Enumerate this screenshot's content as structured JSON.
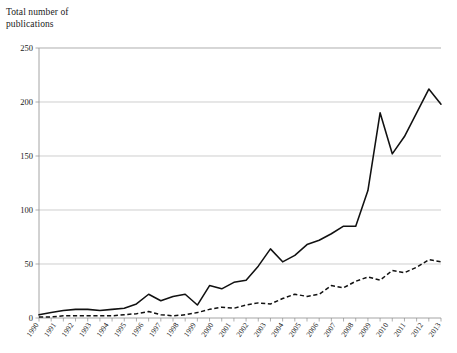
{
  "chart_data": {
    "type": "line",
    "title": "Total number of\npublications",
    "xlabel": "",
    "ylabel": "Total number of publications",
    "ylim": [
      0,
      250
    ],
    "yticks": [
      0,
      50,
      100,
      150,
      200,
      250
    ],
    "grid": true,
    "legend": "none",
    "categories": [
      "1990",
      "1991",
      "1992",
      "1993",
      "1994",
      "1995",
      "1996",
      "1997",
      "1998",
      "1999",
      "2000",
      "2001",
      "2002",
      "2003",
      "2004",
      "2005",
      "2006",
      "2007",
      "2008",
      "2009",
      "2010",
      "2011",
      "2012",
      "2013"
    ],
    "series": [
      {
        "name": "solid-line",
        "style": "solid",
        "color": "#111111",
        "values": [
          3,
          5,
          8,
          9,
          9,
          8,
          9,
          10,
          13,
          22,
          13,
          28,
          35,
          47,
          64,
          52,
          57,
          68,
          72,
          78,
          85,
          85,
          118,
          190
        ]
      },
      {
        "name": "dashed-line",
        "style": "dashed",
        "color": "#111111",
        "values": [
          1,
          2,
          2,
          3,
          2,
          2,
          3,
          5,
          7,
          11,
          4,
          3,
          6,
          10,
          12,
          14,
          13,
          18,
          22,
          20,
          22,
          30,
          28,
          34
        ]
      }
    ],
    "series_full": [
      {
        "name": "solid-line",
        "style": "solid",
        "points": [
          {
            "x": "1990",
            "y": 3
          },
          {
            "x": "1991",
            "y": 5
          },
          {
            "x": "1992",
            "y": 7
          },
          {
            "x": "1993",
            "y": 8
          },
          {
            "x": "1994",
            "y": 8
          },
          {
            "x": "1995",
            "y": 7
          },
          {
            "x": "1996",
            "y": 8
          },
          {
            "x": "1997",
            "y": 9
          },
          {
            "x": "1998",
            "y": 13
          },
          {
            "x": "1999",
            "y": 22
          },
          {
            "x": "2000",
            "y": 16
          },
          {
            "x": "2001",
            "y": 20
          },
          {
            "x": "2002",
            "y": 22
          },
          {
            "x": "2003",
            "y": 12
          },
          {
            "x": "2004",
            "y": 30
          },
          {
            "x": "2005",
            "y": 27
          },
          {
            "x": "2006",
            "y": 33
          },
          {
            "x": "2007",
            "y": 35
          },
          {
            "x": "2008",
            "y": 48
          },
          {
            "x": "2009",
            "y": 64
          },
          {
            "x": "2010",
            "y": 52
          },
          {
            "x": "2011",
            "y": 58
          },
          {
            "x": "2012",
            "y": 68
          },
          {
            "x": "2013",
            "y": 72
          }
        ]
      }
    ],
    "annotations": []
  },
  "chart_render": {
    "solid_values": [
      3,
      5,
      7,
      8,
      8,
      7,
      8,
      9,
      13,
      22,
      16,
      20,
      22,
      12,
      30,
      27,
      33,
      35,
      48,
      64,
      52,
      58,
      68,
      72,
      78,
      85,
      85,
      118,
      190,
      152,
      168,
      190,
      212,
      198
    ],
    "dashed_values": [
      1,
      1,
      2,
      2,
      2,
      2,
      2,
      3,
      4,
      6,
      3,
      2,
      3,
      5,
      8,
      10,
      9,
      12,
      14,
      13,
      18,
      22,
      20,
      22,
      30,
      28,
      34,
      38,
      35,
      44,
      42,
      47,
      54,
      52
    ],
    "x_labels": [
      "1990",
      "1991",
      "1992",
      "1993",
      "1994",
      "1995",
      "1996",
      "1997",
      "1998",
      "1999",
      "2000",
      "2001",
      "2002",
      "2003",
      "2004",
      "2005",
      "2006",
      "2007",
      "2008",
      "2009",
      "2010",
      "2011",
      "2012",
      "2013"
    ],
    "y_labels": [
      "0",
      "50",
      "100",
      "150",
      "200",
      "250"
    ],
    "title_line1": "Total number of",
    "title_line2": "publications"
  }
}
